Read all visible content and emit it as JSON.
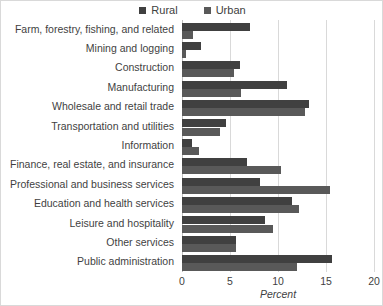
{
  "chart_data": {
    "type": "bar",
    "orientation": "horizontal",
    "title": "",
    "xlabel": "Percent",
    "ylabel": "",
    "xlim": [
      0,
      20
    ],
    "xticks": [
      0,
      5,
      10,
      15,
      20
    ],
    "grid": true,
    "legend_position": "top-center",
    "categories": [
      "Farm, forestry, fishing, and related",
      "Mining and logging",
      "Construction",
      "Manufacturing",
      "Wholesale and retail trade",
      "Transportation and utilities",
      "Information",
      "Finance, real estate, and insurance",
      "Professional and business services",
      "Education and health services",
      "Leisure and hospitality",
      "Other services",
      "Public administration"
    ],
    "series": [
      {
        "name": "Rural",
        "color": "#404040",
        "values": [
          7.1,
          2.0,
          6.0,
          10.9,
          13.2,
          4.6,
          1.0,
          6.8,
          8.1,
          11.5,
          8.6,
          5.6,
          15.6
        ]
      },
      {
        "name": "Urban",
        "color": "#595959",
        "values": [
          1.1,
          0.4,
          5.4,
          6.1,
          12.8,
          4.0,
          1.8,
          10.3,
          15.4,
          12.2,
          9.5,
          5.6,
          12.0
        ]
      }
    ]
  }
}
